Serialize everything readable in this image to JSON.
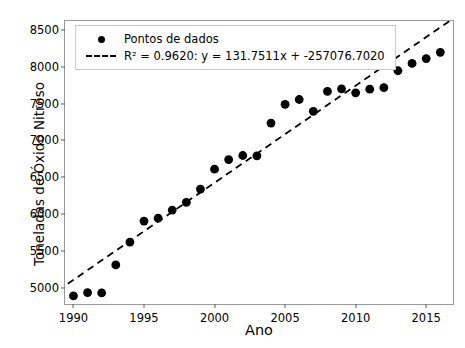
{
  "chart_data": {
    "type": "scatter",
    "title": "",
    "xlabel": "Ano",
    "ylabel": "Toneladas de Óxido Nitroso",
    "xlim": [
      1989.0,
      1989.0
    ],
    "ylim": [
      4780,
      8620
    ],
    "xticks": [
      1990,
      1995,
      2000,
      2005,
      2010,
      2015
    ],
    "yticks": [
      5000,
      5500,
      6000,
      6500,
      7000,
      7500,
      8000,
      8500
    ],
    "grid": false,
    "legend_position": "upper left",
    "x": [
      1990,
      1991,
      1992,
      1993,
      1994,
      1995,
      1996,
      1997,
      1998,
      1999,
      2000,
      2001,
      2002,
      2003,
      2004,
      2005,
      2006,
      2007,
      2008,
      2009,
      2010,
      2011,
      2012,
      2013,
      2014,
      2015,
      2016
    ],
    "values": [
      4890,
      4935,
      4930,
      5310,
      5620,
      5905,
      5945,
      6055,
      6160,
      6340,
      6610,
      6740,
      6795,
      6790,
      7235,
      7490,
      7555,
      7395,
      7665,
      7700,
      7645,
      7695,
      7715,
      7945,
      8045,
      8110,
      8195
    ],
    "series": [
      {
        "name": "Pontos de dados",
        "values": [
          4890,
          4935,
          4930,
          5310,
          5620,
          5905,
          5945,
          6055,
          6160,
          6340,
          6610,
          6740,
          6795,
          6790,
          7235,
          7490,
          7555,
          7395,
          7665,
          7700,
          7645,
          7695,
          7715,
          7945,
          8045,
          8110,
          8195
        ]
      }
    ],
    "trendline": {
      "label": "R² = 0.9620: y = 131.7511x + -257076.7020",
      "slope": 131.7511,
      "intercept": -257076.702,
      "r_squared": 0.962,
      "x_start": 1989.6,
      "x_end": 2016.9,
      "style": "dashed"
    },
    "marker_color": "#000000",
    "line_color": "#000000"
  },
  "legend": {
    "points_label": "Pontos de dados",
    "fit_label": "R² = 0.9620: y = 131.7511x + -257076.7020"
  },
  "axes": {
    "xlabel": "Ano",
    "ylabel": "Toneladas de Óxido Nitroso"
  }
}
